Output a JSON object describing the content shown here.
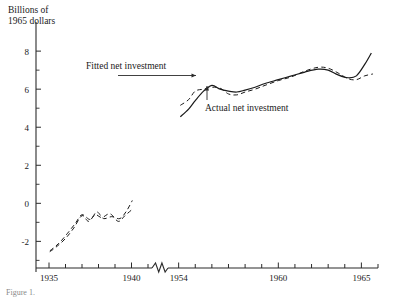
{
  "figure": {
    "ylabel_line1": "Billions of",
    "ylabel_line2": "1965 dollars",
    "caption": "Figure 1."
  },
  "annotations": {
    "fitted": "Fitted net investment",
    "actual": "Actual net investment"
  },
  "chart_data": {
    "type": "line",
    "title": "",
    "xlabel": "",
    "ylabel": "Billions of 1965 dollars",
    "grid": false,
    "legend_position": "inline-annotations",
    "axis_break": {
      "after": 1941,
      "before": 1953,
      "style": "zigzag"
    },
    "ylim": [
      -3.4,
      8.9
    ],
    "yticks_major": [
      -2,
      0,
      2,
      4,
      6,
      8
    ],
    "yticks_minor": [
      -3,
      -1,
      1,
      3,
      5,
      7
    ],
    "ytick_labels": [
      "-2",
      "0",
      "2",
      "4",
      "6",
      "8"
    ],
    "xticks_left": [
      1935,
      1936,
      1937,
      1938,
      1939,
      1940,
      1941
    ],
    "xticks_right": [
      1954,
      1955,
      1956,
      1957,
      1958,
      1959,
      1960,
      1961,
      1962,
      1963,
      1964,
      1965,
      1966
    ],
    "xtick_labels_shown": [
      "1935",
      "1940",
      "1954",
      "1960",
      "1965"
    ],
    "series": [
      {
        "name": "Actual net investment",
        "style": "solid",
        "color": "#1a1a1a",
        "x": [
          1954.1,
          1954.6,
          1955.0,
          1955.5,
          1956.0,
          1956.5,
          1957.0,
          1957.5,
          1958.0,
          1958.6,
          1959.2,
          1960.0,
          1960.8,
          1961.6,
          1962.4,
          1963.0,
          1963.6,
          1964.2,
          1964.7,
          1965.2,
          1965.6
        ],
        "y": [
          4.55,
          4.95,
          5.4,
          5.9,
          6.2,
          6.0,
          5.9,
          5.85,
          5.95,
          6.1,
          6.3,
          6.5,
          6.7,
          6.9,
          7.05,
          7.0,
          6.75,
          6.6,
          6.7,
          7.3,
          7.9
        ]
      },
      {
        "name": "Fitted net investment",
        "style": "dashed",
        "color": "#1a1a1a",
        "x": [
          1954.1,
          1954.6,
          1955.0,
          1955.5,
          1956.0,
          1956.5,
          1957.0,
          1957.5,
          1958.0,
          1958.6,
          1959.2,
          1960.0,
          1960.8,
          1961.6,
          1962.4,
          1963.0,
          1963.6,
          1964.2,
          1964.7,
          1965.2,
          1965.7
        ],
        "y": [
          5.15,
          5.45,
          5.9,
          6.0,
          6.1,
          6.05,
          5.75,
          5.7,
          5.85,
          6.0,
          6.2,
          6.45,
          6.65,
          6.95,
          7.15,
          7.1,
          6.85,
          6.55,
          6.5,
          6.7,
          6.8
        ]
      },
      {
        "name": "Actual net investment (prewar)",
        "style": "dashed",
        "color": "#1a1a1a",
        "x": [
          1935.05,
          1935.5,
          1936.0,
          1936.5,
          1937.0,
          1937.4,
          1937.8,
          1938.2,
          1938.7,
          1939.2,
          1939.6,
          1940.0
        ],
        "y": [
          -2.55,
          -2.25,
          -1.85,
          -1.3,
          -0.65,
          -0.95,
          -0.6,
          -0.75,
          -0.55,
          -0.95,
          -0.65,
          -0.35
        ]
      },
      {
        "name": "Fitted net investment (prewar)",
        "style": "dashed",
        "color": "#1a1a1a",
        "x": [
          1935.05,
          1935.6,
          1936.1,
          1936.6,
          1937.0,
          1937.5,
          1937.9,
          1938.3,
          1938.8,
          1939.3,
          1939.7,
          1940.05
        ],
        "y": [
          -2.5,
          -2.1,
          -1.6,
          -1.05,
          -0.6,
          -0.85,
          -0.45,
          -0.8,
          -0.7,
          -0.8,
          -0.4,
          0.15
        ]
      }
    ]
  }
}
